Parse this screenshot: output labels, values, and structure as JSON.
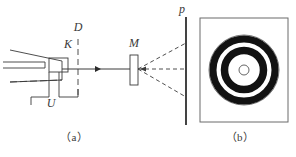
{
  "figure": {
    "stroke_color": "#3a3a3a",
    "ring_color": "#121212",
    "background": "#ffffff"
  },
  "panel_a": {
    "caption": "（a）",
    "labels": {
      "cathode": "K",
      "voltage": "U",
      "diaphragm": "D",
      "target": "M",
      "plate": "p"
    }
  },
  "panel_b": {
    "caption": "（b）",
    "frame": {
      "x": 200,
      "y": 18,
      "width": 88,
      "height": 104
    }
  },
  "chart_data": {
    "type": "scatter",
    "center": {
      "x": 244,
      "y": 70
    },
    "rings": [
      {
        "name": "outer-halo-circle",
        "radius": 35.0,
        "stroke": "#555555",
        "stroke_width": 0.8,
        "fill": "none"
      },
      {
        "name": "outer-bright-ring",
        "radius": 31.0,
        "stroke": "#121212",
        "stroke_width": 7.0,
        "fill": "none"
      },
      {
        "name": "inner-bright-ring",
        "radius": 19.5,
        "stroke": "#121212",
        "stroke_width": 7.5,
        "fill": "none"
      },
      {
        "name": "central-spot-outline",
        "radius": 5.0,
        "stroke": "#555555",
        "stroke_width": 0.9,
        "fill": "none"
      }
    ],
    "xlabel": "",
    "ylabel": "",
    "grid": false,
    "legend": "none"
  }
}
